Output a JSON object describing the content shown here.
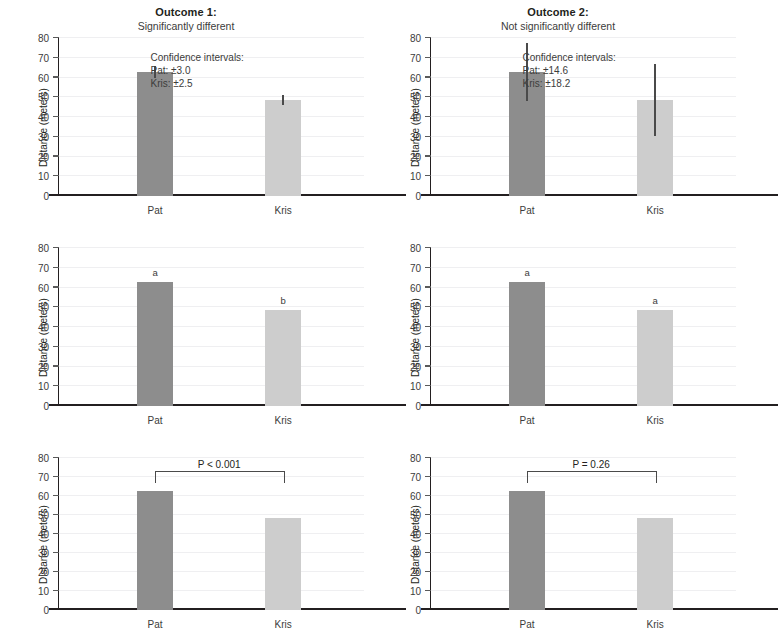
{
  "figure": {
    "width": 744,
    "height": 644,
    "background": "#ffffff"
  },
  "columns": [
    {
      "id": "outcome-1",
      "title_main": "Outcome 1:",
      "title_sub": "Significantly different"
    },
    {
      "id": "outcome-2",
      "title_main": "Outcome 2:",
      "title_sub": "Not significantly different"
    }
  ],
  "axis": {
    "ylabel": "Distance (meters)",
    "yticks": [
      0,
      10,
      20,
      30,
      40,
      50,
      60,
      70,
      80
    ],
    "ylim": [
      0,
      80
    ],
    "categories": [
      "Pat",
      "Kris"
    ]
  },
  "colors": {
    "bar_pat": "#8d8d8d",
    "bar_kris": "#cdcdcd",
    "axis": "#231f20",
    "grid": "#efeff1",
    "errorbar": "#4a4a4a",
    "text": "#3c3c3b"
  },
  "ci_notes": {
    "outcome1": {
      "heading": "Confidence intervals:",
      "pat": "Pat: ±3.0",
      "kris": "Kris: ±2.5"
    },
    "outcome2": {
      "heading": "Confidence intervals:",
      "pat": "Pat: ±14.6",
      "kris": "Kris: ±18.2"
    }
  },
  "letters": {
    "outcome1": {
      "pat": "a",
      "kris": "b"
    },
    "outcome2": {
      "pat": "a",
      "kris": "a"
    }
  },
  "pvalues": {
    "outcome1": "P < 0.001",
    "outcome2": "P = 0.26"
  },
  "chart_data": {
    "type": "bar",
    "xlabel": "",
    "ylabel": "Distance (meters)",
    "ylim": [
      0,
      80
    ],
    "yticks": [
      0,
      10,
      20,
      30,
      40,
      50,
      60,
      70,
      80
    ],
    "grid": true,
    "legend": "none",
    "categories": [
      "Pat",
      "Kris"
    ],
    "panels": [
      {
        "row": 1,
        "column": "Outcome 1",
        "style": "error-bars",
        "values": [
          62.9,
          48.6
        ],
        "errors": [
          3.0,
          2.5
        ],
        "error_low": [
          59.9,
          46.1
        ],
        "error_high": [
          65.9,
          51.1
        ],
        "annotation": "Confidence intervals: Pat: ±3.0  Kris: ±2.5"
      },
      {
        "row": 1,
        "column": "Outcome 2",
        "style": "error-bars",
        "values": [
          62.9,
          48.6
        ],
        "errors": [
          14.6,
          18.2
        ],
        "error_low": [
          48.3,
          30.4
        ],
        "error_high": [
          77.5,
          66.8
        ],
        "annotation": "Confidence intervals: Pat: ±14.6  Kris: ±18.2"
      },
      {
        "row": 2,
        "column": "Outcome 1",
        "style": "letters",
        "values": [
          62.9,
          48.6
        ],
        "letters": [
          "a",
          "b"
        ]
      },
      {
        "row": 2,
        "column": "Outcome 2",
        "style": "letters",
        "values": [
          62.9,
          48.6
        ],
        "letters": [
          "a",
          "a"
        ]
      },
      {
        "row": 3,
        "column": "Outcome 1",
        "style": "p-value-bracket",
        "values": [
          62.9,
          48.6
        ],
        "pvalue": "P < 0.001"
      },
      {
        "row": 3,
        "column": "Outcome 2",
        "style": "p-value-bracket",
        "values": [
          62.9,
          48.6
        ],
        "pvalue": "P = 0.26"
      }
    ]
  }
}
